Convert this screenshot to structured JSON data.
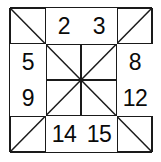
{
  "figure": {
    "background_color": "#ffffff",
    "line_color": "#1a1a1a",
    "text_color": "#0a0a0a",
    "grid": {
      "rows": 4,
      "cols": 4,
      "left": 10,
      "top": 8,
      "right": 152,
      "bottom": 152,
      "x_lines": [
        10,
        46,
        81,
        117,
        152
      ],
      "y_lines": [
        8,
        44,
        80,
        116,
        152
      ],
      "center": [
        81,
        80
      ]
    },
    "diagonals": [
      {
        "name": "main-diagonal",
        "from": [
          10,
          8
        ],
        "to": [
          152,
          152
        ]
      },
      {
        "name": "anti-diagonal",
        "from": [
          10,
          152
        ],
        "to": [
          152,
          8
        ]
      }
    ],
    "cells": [
      {
        "row": 0,
        "col": 0,
        "value": "",
        "x": 10,
        "y": 8
      },
      {
        "row": 0,
        "col": 1,
        "value": "2",
        "x": 46,
        "y": 8
      },
      {
        "row": 0,
        "col": 2,
        "value": "3",
        "x": 81,
        "y": 8
      },
      {
        "row": 0,
        "col": 3,
        "value": "",
        "x": 117,
        "y": 8
      },
      {
        "row": 1,
        "col": 0,
        "value": "5",
        "x": 10,
        "y": 44
      },
      {
        "row": 1,
        "col": 1,
        "value": "",
        "x": 46,
        "y": 44
      },
      {
        "row": 1,
        "col": 2,
        "value": "",
        "x": 81,
        "y": 44
      },
      {
        "row": 1,
        "col": 3,
        "value": "8",
        "x": 117,
        "y": 44
      },
      {
        "row": 2,
        "col": 0,
        "value": "9",
        "x": 10,
        "y": 80
      },
      {
        "row": 2,
        "col": 1,
        "value": "",
        "x": 46,
        "y": 80
      },
      {
        "row": 2,
        "col": 2,
        "value": "",
        "x": 81,
        "y": 80
      },
      {
        "row": 2,
        "col": 3,
        "value": "12",
        "x": 117,
        "y": 80
      },
      {
        "row": 3,
        "col": 0,
        "value": "",
        "x": 10,
        "y": 116
      },
      {
        "row": 3,
        "col": 1,
        "value": "14",
        "x": 46,
        "y": 116
      },
      {
        "row": 3,
        "col": 2,
        "value": "15",
        "x": 81,
        "y": 116
      },
      {
        "row": 3,
        "col": 3,
        "value": "",
        "x": 117,
        "y": 116
      }
    ],
    "visible_numbers": [
      "2",
      "3",
      "5",
      "8",
      "9",
      "12",
      "14",
      "15"
    ]
  }
}
